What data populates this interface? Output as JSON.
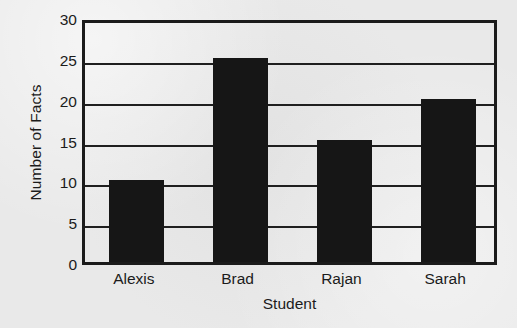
{
  "chart_data": {
    "type": "bar",
    "title": "",
    "xlabel": "Student",
    "ylabel": "Number of Facts",
    "categories": [
      "Alexis",
      "Brad",
      "Rajan",
      "Sarah"
    ],
    "values": [
      10,
      25,
      15,
      20
    ],
    "series": [
      {
        "name": "Number of Facts",
        "values": [
          10,
          25,
          15,
          20
        ]
      }
    ],
    "ylim": [
      0,
      30
    ],
    "ytick_labels": [
      "0",
      "5",
      "10",
      "15",
      "20",
      "25",
      "30"
    ],
    "ytick_values": [
      0,
      5,
      10,
      15,
      20,
      25,
      30
    ],
    "grid": true,
    "grid_axis": "y",
    "legend": false,
    "legend_position": "none",
    "bar_color": "#161616",
    "axis_color": "#1b1b1b",
    "background_color": "#e9e9e9"
  }
}
